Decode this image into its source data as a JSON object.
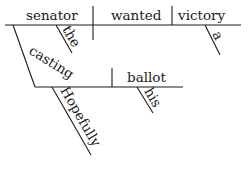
{
  "diagram": {
    "type": "sentence-diagram",
    "style": "Reed-Kellogg",
    "stroke_color": "#1a1a1a",
    "background": "#ffffff",
    "words": {
      "subject": "senator",
      "verb": "wanted",
      "object": "victory",
      "subject_modifier": "the",
      "object_modifier": "a",
      "gerund": "casting",
      "gerund_object": "ballot",
      "gerund_object_modifier": "his",
      "adverb": "Hopefully"
    }
  }
}
